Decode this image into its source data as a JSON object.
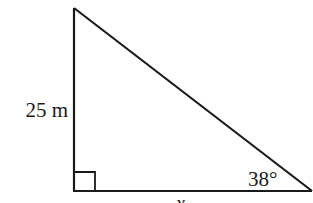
{
  "diagram": {
    "type": "right-triangle",
    "stroke_color": "#1a1a1a",
    "background": "#ffffff",
    "vertices": {
      "top": [
        74,
        8
      ],
      "right_angle": [
        74,
        191
      ],
      "right": [
        311,
        191
      ]
    },
    "labels": {
      "vertical_side": "25 m",
      "angle": "38°",
      "base": "x"
    },
    "right_angle_marker": true
  }
}
